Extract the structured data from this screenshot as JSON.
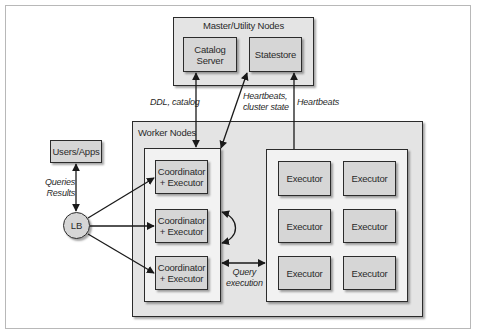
{
  "diagram": {
    "master": {
      "title": "Master/Utility Nodes",
      "catalog_server": "Catalog\nServer",
      "statestore": "Statestore"
    },
    "users_apps": "Users/Apps",
    "load_balancer": "LB",
    "worker": {
      "title": "Worker Nodes",
      "coordinators": [
        "Coordinator\n+ Executor",
        "Coordinator\n+ Executor",
        "Coordinator\n+ Executor"
      ],
      "executors": [
        "Executor",
        "Executor",
        "Executor",
        "Executor",
        "Executor",
        "Executor"
      ]
    },
    "edge_labels": {
      "ddl_catalog": "DDL, catalog",
      "heartbeats_cluster_state": "Heartbeats,\ncluster state",
      "heartbeats": "Heartbeats",
      "queries_results": "Queries\nResults",
      "query_execution": "Query\nexecution"
    },
    "colors": {
      "node_fill": "#d6d6d6",
      "outer_fill": "#e4e4e4",
      "group_fill": "#f2f2f2",
      "stroke": "#2b2b2b"
    }
  }
}
